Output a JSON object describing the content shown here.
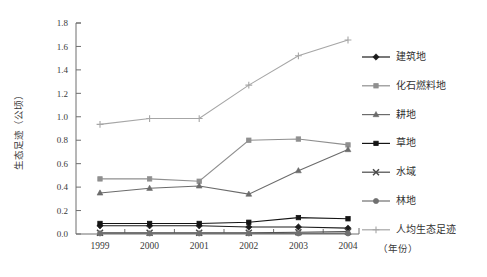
{
  "chart_data": {
    "type": "line",
    "title": "",
    "xlabel": "（年份）",
    "ylabel": "生态足迹（公顷）",
    "categories": [
      "1999",
      "2000",
      "2001",
      "2002",
      "2003",
      "2004"
    ],
    "x": [
      1999,
      2000,
      2001,
      2002,
      2003,
      2004
    ],
    "ylim": [
      0.0,
      1.8
    ],
    "yticks": [
      "0.0",
      "0.2",
      "0.4",
      "0.6",
      "0.8",
      "1.0",
      "1.2",
      "1.4",
      "1.6",
      "1.8"
    ],
    "ytick_values": [
      0.0,
      0.2,
      0.4,
      0.6,
      0.8,
      1.0,
      1.2,
      1.4,
      1.6,
      1.8
    ],
    "grid": false,
    "legend_position": "right",
    "series": [
      {
        "name": "建筑地",
        "marker": "diamond",
        "color": "#1d1d1d",
        "values": [
          0.07,
          0.07,
          0.07,
          0.06,
          0.06,
          0.05
        ]
      },
      {
        "name": "化石燃料地",
        "marker": "square",
        "color": "#8f8f8f",
        "values": [
          0.47,
          0.47,
          0.45,
          0.8,
          0.81,
          0.76
        ]
      },
      {
        "name": "耕地",
        "marker": "triangle",
        "color": "#6b6b6b",
        "values": [
          0.35,
          0.39,
          0.41,
          0.34,
          0.54,
          0.72
        ]
      },
      {
        "name": "草地",
        "marker": "square",
        "color": "#141414",
        "values": [
          0.09,
          0.09,
          0.09,
          0.1,
          0.14,
          0.13
        ]
      },
      {
        "name": "水域",
        "marker": "x",
        "color": "#4a4a4a",
        "values": [
          0.01,
          0.01,
          0.01,
          0.01,
          0.015,
          0.02
        ]
      },
      {
        "name": "林地",
        "marker": "circle",
        "color": "#707070",
        "values": [
          0.005,
          0.005,
          0.005,
          0.005,
          0.005,
          0.005
        ]
      },
      {
        "name": "人均生态足迹",
        "marker": "plus",
        "color": "#a6a6a6",
        "values": [
          0.935,
          0.985,
          0.985,
          1.27,
          1.52,
          1.655
        ]
      }
    ]
  },
  "legend": {
    "items": [
      {
        "label": "建筑地"
      },
      {
        "label": "化石燃料地"
      },
      {
        "label": "耕地"
      },
      {
        "label": "草地"
      },
      {
        "label": "水域"
      },
      {
        "label": "林地"
      },
      {
        "label": "人均生态足迹"
      }
    ]
  },
  "axes": {
    "y_title": "生态足迹（公顷）",
    "x_title": "（年份）"
  }
}
